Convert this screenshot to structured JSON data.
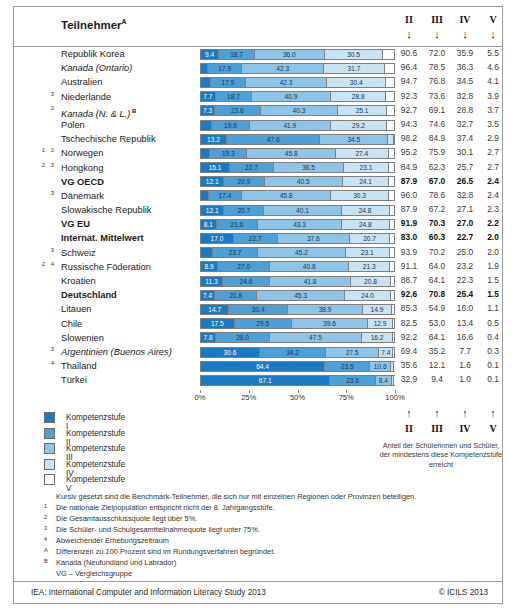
{
  "header": {
    "title": "Teilnehmer",
    "title_sup": "A",
    "levels": [
      "II",
      "III",
      "IV",
      "V"
    ],
    "arrow": "↓"
  },
  "axis": {
    "ticks": [
      "0%",
      "25%",
      "50%",
      "75%",
      "100%"
    ]
  },
  "legend": {
    "items": [
      {
        "label": "Kompetenzstufe I",
        "color": "#1a7ac4"
      },
      {
        "label": "Kompetenzstufe II",
        "color": "#4d9fd8"
      },
      {
        "label": "Kompetenzstufe III",
        "color": "#8fc4e8"
      },
      {
        "label": "Kompetenzstufe IV",
        "color": "#c9e2f4"
      },
      {
        "label": "Kompetenzstufe V",
        "color": "#ffffff"
      }
    ]
  },
  "right_legend": {
    "arrows": [
      "↑",
      "↑",
      "↑",
      "↑"
    ],
    "levels": [
      "II",
      "III",
      "IV",
      "V"
    ],
    "note": "Anteil der Schülerinnen und Schüler, der mindestens diese Kompetenzstufe erreicht"
  },
  "notes": [
    {
      "mark": "",
      "text": "Kursiv gesetzt sind die Benchmark-Teilnehmer, die sich nur mit einzelnen Regionen oder Provinzen beteiligen."
    },
    {
      "mark": "1",
      "text": "Die nationale Zielpopulation entspricht nicht der 8. Jahrgangsstufe."
    },
    {
      "mark": "2",
      "text": "Die Gesamtausschlussquote liegt über 5%."
    },
    {
      "mark": "3",
      "text": "Die Schüler- und Schulgesamtteilnahmequote liegt unter 75%."
    },
    {
      "mark": "4",
      "text": "Abweichender Erhebungszeitraum"
    },
    {
      "mark": "A",
      "text": "Differenzen zu 100 Prozent sind im Rundungsverfahren begründet."
    },
    {
      "mark": "B",
      "text": "Kanada (Neufundland und Labrador)"
    },
    {
      "mark": "",
      "text": "VG – Vergleichsgruppe"
    }
  ],
  "footer": {
    "left": "IEA: International Computer and Information Literacy Study 2013",
    "right": "© ICILS 2013"
  },
  "chart_data": {
    "type": "bar",
    "orientation": "horizontal",
    "stacked": true,
    "title": "Teilnehmer",
    "xlabel": "",
    "ylabel": "",
    "xlim": [
      0,
      100
    ],
    "grid": false,
    "legend_position": "bottom-left",
    "series": [
      {
        "name": "Kompetenzstufe I",
        "color": "#1a7ac4"
      },
      {
        "name": "Kompetenzstufe II",
        "color": "#4d9fd8"
      },
      {
        "name": "Kompetenzstufe III",
        "color": "#8fc4e8"
      },
      {
        "name": "Kompetenzstufe IV",
        "color": "#c9e2f4"
      },
      {
        "name": "Kompetenzstufe V",
        "color": "#ffffff"
      }
    ],
    "cumulative_columns": [
      "II",
      "III",
      "IV",
      "V"
    ],
    "rows": [
      {
        "sup": "",
        "country": "Republik Korea",
        "italic": false,
        "bold": false,
        "country_sup": "",
        "values": [
          9.4,
          18.7,
          36.0,
          30.5,
          5.5
        ],
        "cumulative": [
          "90.6",
          "72.0",
          "35.9",
          "5.5"
        ]
      },
      {
        "sup": "",
        "country": "Kanada (Ontario)",
        "italic": true,
        "bold": false,
        "country_sup": "",
        "values": [
          3.6,
          17.9,
          42.3,
          31.7,
          4.6
        ],
        "cumulative": [
          "96.4",
          "78.5",
          "36.3",
          "4.6"
        ]
      },
      {
        "sup": "",
        "country": "Australien",
        "italic": false,
        "bold": false,
        "country_sup": "",
        "values": [
          5.3,
          17.9,
          42.3,
          30.4,
          4.1
        ],
        "cumulative": [
          "94.7",
          "76.8",
          "34.5",
          "4.1"
        ]
      },
      {
        "sup": "3",
        "country": "Niederlande",
        "italic": false,
        "bold": false,
        "country_sup": "",
        "values": [
          7.7,
          18.7,
          40.9,
          28.8,
          3.9
        ],
        "cumulative": [
          "92.3",
          "73.6",
          "32.8",
          "3.9"
        ]
      },
      {
        "sup": "2",
        "country": "Kanada (N. & L.)",
        "italic": true,
        "bold": false,
        "country_sup": "B",
        "values": [
          7.3,
          23.6,
          40.3,
          25.1,
          3.7
        ],
        "cumulative": [
          "92.7",
          "69.1",
          "28.8",
          "3.7"
        ]
      },
      {
        "sup": "",
        "country": "Polen",
        "italic": false,
        "bold": false,
        "country_sup": "",
        "values": [
          5.7,
          19.6,
          41.9,
          29.2,
          3.5
        ],
        "cumulative": [
          "94.3",
          "74.6",
          "32.7",
          "3.5"
        ]
      },
      {
        "sup": "",
        "country": "Tschechische Republik",
        "italic": false,
        "bold": false,
        "country_sup": "",
        "values": [
          13.2,
          47.6,
          34.5,
          2.9,
          0.0
        ],
        "cumulative": [
          "98.2",
          "84.9",
          "37.4",
          "2.9"
        ],
        "layout": "alt1"
      },
      {
        "sup": "1 2",
        "country": "Norwegen",
        "italic": false,
        "bold": false,
        "country_sup": "",
        "values": [
          4.8,
          19.3,
          45.8,
          27.4,
          2.7
        ],
        "cumulative": [
          "95.2",
          "75.9",
          "30.1",
          "2.7"
        ]
      },
      {
        "sup": "2 3",
        "country": "Hongkong",
        "italic": false,
        "bold": false,
        "country_sup": "",
        "values": [
          15.1,
          22.7,
          36.5,
          23.1,
          2.7
        ],
        "cumulative": [
          "84.9",
          "62.3",
          "25.7",
          "2.7"
        ]
      },
      {
        "sup": "",
        "country": "VG OECD",
        "italic": false,
        "bold": true,
        "country_sup": "",
        "values": [
          12.1,
          20.9,
          40.5,
          24.1,
          2.4
        ],
        "cumulative": [
          "87.9",
          "67.0",
          "26.5",
          "2.4"
        ]
      },
      {
        "sup": "3",
        "country": "Dänemark",
        "italic": false,
        "bold": false,
        "country_sup": "",
        "values": [
          4.0,
          17.4,
          45.8,
          30.3,
          2.4
        ],
        "cumulative": [
          "96.0",
          "78.6",
          "32.8",
          "2.4"
        ]
      },
      {
        "sup": "",
        "country": "Slowakische Republik",
        "italic": false,
        "bold": false,
        "country_sup": "",
        "values": [
          12.1,
          20.7,
          40.1,
          24.8,
          2.3
        ],
        "cumulative": [
          "87.9",
          "67.2",
          "27.1",
          "2.3"
        ]
      },
      {
        "sup": "",
        "country": "VG EU",
        "italic": false,
        "bold": true,
        "country_sup": "",
        "values": [
          8.1,
          21.6,
          43.3,
          24.8,
          2.2
        ],
        "cumulative": [
          "91.9",
          "70.3",
          "27.0",
          "2.2"
        ]
      },
      {
        "sup": "",
        "country": "Internat. Mittelwert",
        "italic": false,
        "bold": true,
        "country_sup": "",
        "values": [
          17.0,
          22.7,
          37.6,
          20.7,
          2.0
        ],
        "cumulative": [
          "83.0",
          "60.3",
          "22.7",
          "2.0"
        ]
      },
      {
        "sup": "3",
        "country": "Schweiz",
        "italic": false,
        "bold": false,
        "country_sup": "",
        "values": [
          6.1,
          23.7,
          45.2,
          23.1,
          2.0
        ],
        "cumulative": [
          "93.9",
          "70.2",
          "25.0",
          "2.0"
        ]
      },
      {
        "sup": "2 4",
        "country": "Russische Föderation",
        "italic": false,
        "bold": false,
        "country_sup": "",
        "values": [
          8.9,
          27.0,
          40.8,
          21.3,
          1.9
        ],
        "cumulative": [
          "91.1",
          "64.0",
          "23.2",
          "1.9"
        ]
      },
      {
        "sup": "",
        "country": "Kroatien",
        "italic": false,
        "bold": false,
        "country_sup": "",
        "values": [
          11.3,
          24.6,
          41.8,
          20.8,
          1.5
        ],
        "cumulative": [
          "88.7",
          "64.1",
          "22.3",
          "1.5"
        ]
      },
      {
        "sup": "",
        "country": "Deutschland",
        "italic": false,
        "bold": true,
        "country_sup": "",
        "values": [
          7.4,
          21.8,
          45.3,
          24.0,
          1.5
        ],
        "cumulative": [
          "92.6",
          "70.8",
          "25.4",
          "1.5"
        ]
      },
      {
        "sup": "",
        "country": "Litauen",
        "italic": false,
        "bold": false,
        "country_sup": "",
        "values": [
          14.7,
          30.4,
          38.9,
          14.9,
          1.1
        ],
        "cumulative": [
          "85.3",
          "54.9",
          "16.0",
          "1.1"
        ]
      },
      {
        "sup": "",
        "country": "Chile",
        "italic": false,
        "bold": false,
        "country_sup": "",
        "values": [
          17.5,
          29.5,
          39.6,
          12.9,
          0.5
        ],
        "cumulative": [
          "82.5",
          "53.0",
          "13.4",
          "0.5"
        ]
      },
      {
        "sup": "",
        "country": "Slowenien",
        "italic": false,
        "bold": false,
        "country_sup": "",
        "values": [
          7.8,
          28.0,
          47.5,
          16.2,
          0.4
        ],
        "cumulative": [
          "92.2",
          "64.1",
          "16.6",
          "0.4"
        ]
      },
      {
        "sup": "3",
        "country": "Argentinien (Buenos Aires)",
        "italic": true,
        "bold": false,
        "country_sup": "",
        "values": [
          30.6,
          34.2,
          27.5,
          7.4,
          0.3
        ],
        "cumulative": [
          "69.4",
          "35.2",
          "7.7",
          "0.3"
        ],
        "layout": "alt2"
      },
      {
        "sup": "4",
        "country": "Thailand",
        "italic": false,
        "bold": false,
        "country_sup": "",
        "values": [
          64.4,
          23.5,
          10.6,
          1.5,
          0.1
        ],
        "cumulative": [
          "35.6",
          "12.1",
          "1.6",
          "0.1"
        ],
        "layout": "alt3"
      },
      {
        "sup": "",
        "country": "Türkei",
        "italic": false,
        "bold": false,
        "country_sup": "",
        "values": [
          67.1,
          23.6,
          8.4,
          0.9,
          0.1
        ],
        "cumulative": [
          "32.9",
          "9.4",
          "1.0",
          "0.1"
        ],
        "layout": "alt3"
      }
    ]
  }
}
